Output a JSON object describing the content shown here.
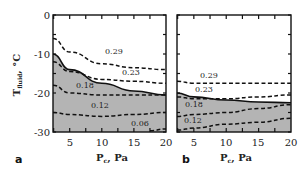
{
  "chart_data": [
    {
      "panel": "a",
      "type": "line",
      "title": "",
      "xlabel": "P_c, Pa",
      "ylabel": "T_fluid, °C",
      "xlim": [
        2.4,
        20
      ],
      "ylim": [
        -30,
        0
      ],
      "x_ticks": [
        5,
        10,
        15,
        20
      ],
      "y_ticks": [
        0,
        -10,
        -20,
        -30
      ],
      "grid": false,
      "shaded_region": "below solid boundary curve (gray)",
      "x": [
        2.4,
        5,
        10,
        15,
        20
      ],
      "boundary": {
        "name": "solid boundary",
        "style": "solid",
        "values": [
          -10,
          -14,
          -17.5,
          -19.5,
          -20.5
        ]
      },
      "series": [
        {
          "name": "0.29",
          "style": "dashed",
          "values": [
            -6,
            -9.5,
            -12.5,
            -13.5,
            -14
          ]
        },
        {
          "name": "0.23",
          "style": "dashed",
          "values": [
            -12,
            -14.5,
            -16.5,
            -17,
            -17.5
          ]
        },
        {
          "name": "0.18",
          "style": "dashed",
          "values": [
            -18,
            -20,
            -20.5,
            -20.5,
            -20.5
          ]
        },
        {
          "name": "0.12",
          "style": "dashed",
          "values": [
            -25,
            -25.5,
            -26,
            -25.5,
            -25
          ]
        },
        {
          "name": "0.06",
          "style": "dashed",
          "values": [
            null,
            null,
            null,
            -29.6,
            -29.2
          ]
        }
      ]
    },
    {
      "panel": "b",
      "type": "line",
      "title": "",
      "xlabel": "P_c, Pa",
      "ylabel": "",
      "xlim": [
        2.4,
        20
      ],
      "ylim": [
        -30,
        0
      ],
      "x_ticks": [
        5,
        10,
        15,
        20
      ],
      "y_ticks": [
        0,
        -10,
        -20,
        -30
      ],
      "grid": false,
      "shaded_region": "below solid boundary curve (gray)",
      "x": [
        2.4,
        5,
        10,
        15,
        20
      ],
      "boundary": {
        "name": "solid boundary",
        "style": "solid",
        "values": [
          -20,
          -21,
          -21.8,
          -22.3,
          -22.5
        ]
      },
      "series": [
        {
          "name": "0.29",
          "style": "dashed",
          "values": [
            -17,
            -17.5,
            -17.5,
            -17.5,
            -17.5
          ]
        },
        {
          "name": "0.23",
          "style": "dashed",
          "values": [
            -21,
            -21.5,
            -21.5,
            -21,
            -20.5
          ]
        },
        {
          "name": "0.18",
          "style": "dashed",
          "values": [
            -26,
            -25.5,
            -25,
            -24,
            -23
          ]
        },
        {
          "name": "0.12",
          "style": "dashed",
          "values": [
            -29.5,
            -29,
            -28,
            -27.5,
            -26.5
          ]
        }
      ]
    }
  ],
  "labels": {
    "y_axis_main": "T",
    "y_axis_sub": "fluid",
    "y_axis_unit": ", °C",
    "x_axis_main": "P",
    "x_axis_sub": "c",
    "x_axis_unit": ", Pa",
    "panel_a": "a",
    "panel_b": "b",
    "y_ticks": [
      "0",
      "-10",
      "-20",
      "-30"
    ],
    "x_ticks": [
      "5",
      "10",
      "15",
      "20"
    ],
    "a_curves": [
      "0.29",
      "0.23",
      "0.18",
      "0.12",
      "0.06"
    ],
    "b_curves": [
      "0.29",
      "0.23",
      "0.18",
      "0.12"
    ]
  },
  "colors": {
    "shade": "#b4b4b4",
    "line": "#111111",
    "frame": "#111111"
  }
}
